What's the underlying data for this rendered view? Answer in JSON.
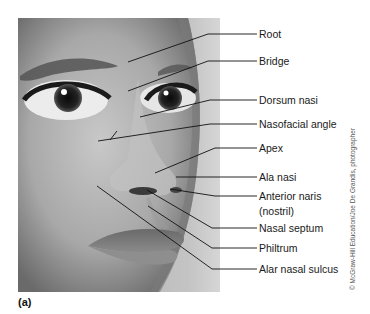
{
  "figure": {
    "panel_label": "(a)",
    "credit": "© McGraw-Hill Education/Joe De Grandis, photographer",
    "image_description": "grayscale close-up photograph of a face showing eyes, nose, and lips"
  },
  "labels": [
    {
      "id": "root",
      "text": "Root"
    },
    {
      "id": "bridge",
      "text": "Bridge"
    },
    {
      "id": "dorsum-nasi",
      "text": "Dorsum nasi"
    },
    {
      "id": "nasofacial-angle",
      "text": "Nasofacial angle"
    },
    {
      "id": "apex",
      "text": "Apex"
    },
    {
      "id": "ala-nasi",
      "text": "Ala nasi"
    },
    {
      "id": "anterior-naris",
      "text": "Anterior naris"
    },
    {
      "id": "anterior-naris-sub",
      "text": "(nostril)"
    },
    {
      "id": "nasal-septum",
      "text": "Nasal septum"
    },
    {
      "id": "philtrum",
      "text": "Philtrum"
    },
    {
      "id": "alar-nasal-sulcus",
      "text": "Alar nasal sulcus"
    }
  ]
}
